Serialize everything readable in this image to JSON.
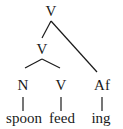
{
  "tree": {
    "root": {
      "label": "V",
      "children": [
        {
          "label": "V",
          "children": [
            {
              "label": "N",
              "word": "spoon"
            },
            {
              "label": "V",
              "word": "feed"
            }
          ]
        },
        {
          "label": "Af",
          "word": "ing"
        }
      ]
    }
  },
  "nodes": {
    "root_label": "V",
    "inner_label": "V",
    "n_label": "N",
    "v_label": "V",
    "af_label": "Af"
  },
  "words": {
    "spoon": "spoon",
    "feed": "feed",
    "ing": "ing"
  }
}
